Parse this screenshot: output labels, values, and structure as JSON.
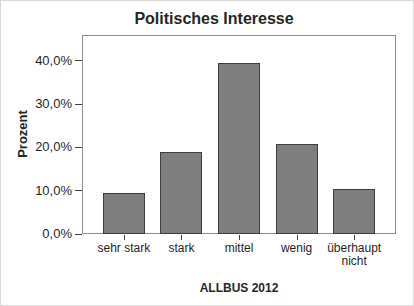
{
  "window": {
    "background": "#ffffff",
    "frame_border": "#d8d8d8"
  },
  "chart_data": {
    "type": "bar",
    "title": "Politisches Interesse",
    "xlabel": "ALLBUS 2012",
    "ylabel": "Prozent",
    "categories": [
      "sehr stark",
      "stark",
      "mittel",
      "wenig",
      "überhaupt nicht"
    ],
    "values": [
      9.5,
      18.9,
      39.6,
      20.7,
      10.5
    ],
    "ylim": [
      0,
      46
    ],
    "yticks": [
      {
        "value": 0,
        "label": "0,0%"
      },
      {
        "value": 10,
        "label": "10,0%"
      },
      {
        "value": 20,
        "label": "20,0%"
      },
      {
        "value": 30,
        "label": "30,0%"
      },
      {
        "value": 40,
        "label": "40,0%"
      }
    ],
    "grid": false,
    "legend": false,
    "colors": {
      "bar_fill": "#7e7e7e",
      "bar_border": "#3e3e3e",
      "axis_frame": "#8e8e8e",
      "tick": "#3f3f3f",
      "text": "#1f1f1f"
    }
  }
}
